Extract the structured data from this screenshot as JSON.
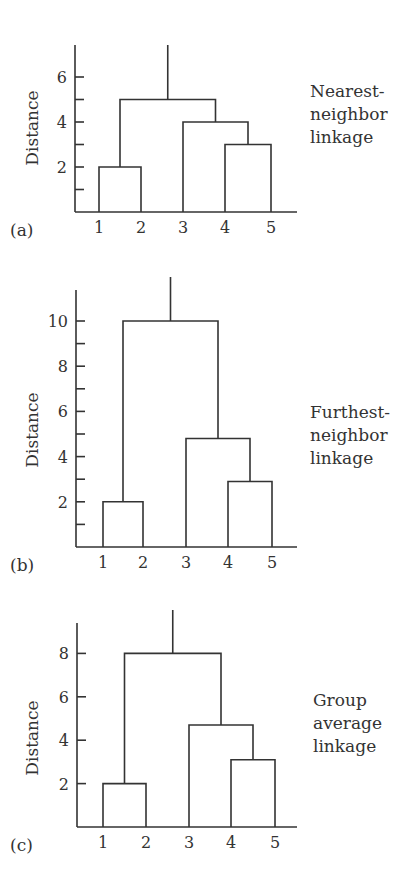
{
  "chart_data": [
    {
      "type": "dendrogram",
      "panel_label": "(a)",
      "title": "Nearest-neighbor linkage",
      "side_label_lines": [
        "Nearest-",
        "neighbor",
        "linkage"
      ],
      "ylabel": "Distance",
      "xlabel": "",
      "ylim": [
        0,
        7.3
      ],
      "yticks_major": [
        2,
        4,
        6
      ],
      "yticks_minor": [
        1,
        3,
        5
      ],
      "leaves": [
        "1",
        "2",
        "3",
        "4",
        "5"
      ],
      "merges": [
        {
          "clusters": [
            [
              "1"
            ],
            [
              "2"
            ]
          ],
          "height": 2
        },
        {
          "clusters": [
            [
              "4"
            ],
            [
              "5"
            ]
          ],
          "height": 3
        },
        {
          "clusters": [
            [
              "3"
            ],
            [
              "4",
              "5"
            ]
          ],
          "height": 4
        },
        {
          "clusters": [
            [
              "1",
              "2"
            ],
            [
              "3",
              "4",
              "5"
            ]
          ],
          "height": 5
        }
      ],
      "grid": false
    },
    {
      "type": "dendrogram",
      "panel_label": "(b)",
      "title": "Furthest-neighbor linkage",
      "side_label_lines": [
        "Furthest-",
        "neighbor",
        "linkage"
      ],
      "ylabel": "Distance",
      "xlabel": "",
      "ylim": [
        0,
        11.3
      ],
      "yticks_major": [
        2,
        4,
        6,
        8,
        10
      ],
      "yticks_minor": [
        1,
        3,
        5,
        7,
        9
      ],
      "leaves": [
        "1",
        "2",
        "3",
        "4",
        "5"
      ],
      "merges": [
        {
          "clusters": [
            [
              "1"
            ],
            [
              "2"
            ]
          ],
          "height": 2
        },
        {
          "clusters": [
            [
              "4"
            ],
            [
              "5"
            ]
          ],
          "height": 2.9
        },
        {
          "clusters": [
            [
              "3"
            ],
            [
              "4",
              "5"
            ]
          ],
          "height": 4.8
        },
        {
          "clusters": [
            [
              "1",
              "2"
            ],
            [
              "3",
              "4",
              "5"
            ]
          ],
          "height": 10
        }
      ],
      "grid": false
    },
    {
      "type": "dendrogram",
      "panel_label": "(c)",
      "title": "Group average linkage",
      "side_label_lines": [
        "Group",
        "average",
        "linkage"
      ],
      "ylabel": "Distance",
      "xlabel": "",
      "ylim": [
        0,
        9.3
      ],
      "yticks_major": [
        2,
        4,
        6,
        8
      ],
      "yticks_minor": [],
      "leaves": [
        "1",
        "2",
        "3",
        "4",
        "5"
      ],
      "merges": [
        {
          "clusters": [
            [
              "1"
            ],
            [
              "2"
            ]
          ],
          "height": 2
        },
        {
          "clusters": [
            [
              "4"
            ],
            [
              "5"
            ]
          ],
          "height": 3.1
        },
        {
          "clusters": [
            [
              "3"
            ],
            [
              "4",
              "5"
            ]
          ],
          "height": 4.7
        },
        {
          "clusters": [
            [
              "1",
              "2"
            ],
            [
              "3",
              "4",
              "5"
            ]
          ],
          "height": 8
        }
      ],
      "grid": false
    }
  ],
  "layout": [
    {
      "axis_x": 75,
      "axis_top": 45,
      "baseline": 212,
      "axis_right": 297,
      "unit_px": 22.5,
      "leaf_x": [
        99,
        141,
        183,
        225,
        271
      ],
      "root_top": 45,
      "label_x": 310,
      "label_y": [
        97,
        120,
        143
      ],
      "panel_label_pos": [
        10,
        236
      ],
      "ylabel_pos": [
        38,
        128
      ]
    },
    {
      "axis_x": 76,
      "axis_top": 290,
      "baseline": 547,
      "axis_right": 297,
      "unit_px": 22.6,
      "leaf_x": [
        103,
        143,
        186,
        228,
        272
      ],
      "root_top": 277,
      "label_x": 310,
      "label_y": [
        418,
        441,
        464
      ],
      "panel_label_pos": [
        10,
        571
      ],
      "ylabel_pos": [
        38,
        430
      ]
    },
    {
      "axis_x": 77,
      "axis_top": 623,
      "baseline": 827,
      "axis_right": 297,
      "unit_px": 21.7,
      "leaf_x": [
        103,
        146,
        189,
        231,
        275
      ],
      "root_top": 610,
      "label_x": 313,
      "label_y": [
        706,
        729,
        752
      ],
      "panel_label_pos": [
        10,
        851
      ],
      "ylabel_pos": [
        38,
        738
      ]
    }
  ]
}
